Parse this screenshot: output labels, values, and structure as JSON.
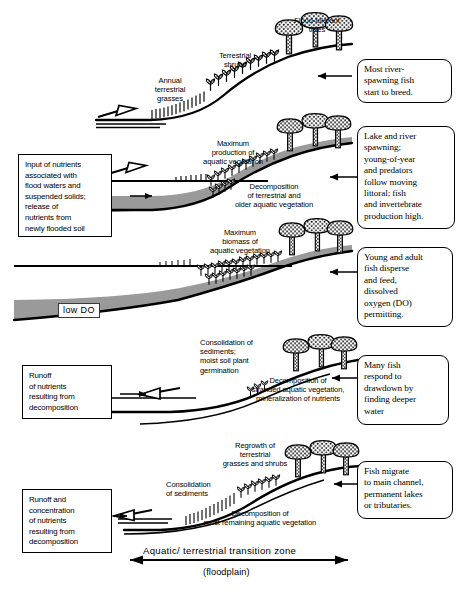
{
  "figure": {
    "title_axis": "Aquatic/ terrestrial   transition   zone",
    "title_axis_sub": "(floodplain)",
    "water_color": "#9a9a9a",
    "ink_color": "#000000"
  },
  "panels": [
    {
      "id": "panel-1-rising-flood",
      "captions": [
        {
          "name": "caption-flood-tolerant-trees",
          "text": "Flood-tolerant\ntrees"
        },
        {
          "name": "caption-terrestrial-shrubs",
          "text": "Terrestrial\nshrubs"
        },
        {
          "name": "caption-annual-terrestrial-grasses",
          "text": "Annual\nterrestrial\ngrasses"
        }
      ],
      "right_callout": {
        "name": "callout-most-river-spawning-fish",
        "text": "Most river-\nspawning fish\nstart to breed."
      },
      "flow_arrow": "rising-right"
    },
    {
      "id": "panel-2-max-production",
      "captions": [
        {
          "name": "caption-maximum-production-aquatic-vegetation",
          "text": "Maximum\nproduction of\naquatic vegetation"
        },
        {
          "name": "caption-decomposition-terrestrial-older-aquatic",
          "text": "Decomposition\nof terrestrial and\nolder aquatic vegetation"
        }
      ],
      "left_box": {
        "name": "box-input-of-nutrients",
        "text": "Input of nutrients\nassociated with\nflood waters and\nsuspended solids;\nrelease of\nnutrients from\nnewly flooded soil"
      },
      "right_callout": {
        "name": "callout-lake-and-river-spawning",
        "text": "Lake and river\nspawning;\nyoung-of-year\nand predators\nfollow moving\nlittoral; fish\nand invertebrate\nproduction high."
      },
      "flow_arrow": "rising-right"
    },
    {
      "id": "panel-3-max-biomass",
      "captions": [
        {
          "name": "caption-maximum-biomass-aquatic-vegetation",
          "text": "Maximum\nbiomass of\naquatic vegetation"
        }
      ],
      "water_label": {
        "name": "label-low-do",
        "text": "low DO"
      },
      "right_callout": {
        "name": "callout-young-and-adult-fish",
        "text": "Young and adult\nfish disperse\nand feed,\ndissolved\noxygen (DO)\npermitting."
      },
      "flow_arrow": "none"
    },
    {
      "id": "panel-4-drawdown",
      "captions": [
        {
          "name": "caption-consolidation-sediments-germination",
          "text": "Consolidation of\nsediments;\nmoist soil plant\ngermination"
        },
        {
          "name": "caption-decomposition-stranded-vegetation",
          "text": "Decomposition of\nstranded aquatic vegetation,\nmineralization of nutrients"
        }
      ],
      "left_box": {
        "name": "box-runoff-of-nutrients",
        "text": "Runoff\nof nutrients\nresulting from\ndecomposition"
      },
      "right_callout": {
        "name": "callout-many-fish-respond-to-drawdown",
        "text": "Many fish\nrespond to\ndrawdown by\nfinding deeper\nwater"
      },
      "flow_arrow": "falling-left"
    },
    {
      "id": "panel-5-regrowth",
      "captions": [
        {
          "name": "caption-regrowth-terrestrial-grasses-shrubs",
          "text": "Regrowth of\nterrestrial\ngrasses and shrubs"
        },
        {
          "name": "caption-consolidation-of-sediments",
          "text": "Consolidation\nof sediments"
        },
        {
          "name": "caption-decomposition-most-remaining",
          "text": "Decomposition of\nmost remaining aquatic vegetation"
        }
      ],
      "left_box": {
        "name": "box-runoff-and-concentration-of-nutrients",
        "text": "Runoff and\nconcentration\nof nutrients\nresulting from\ndecomposition"
      },
      "right_callout": {
        "name": "callout-fish-migrate-to-main-channel",
        "text": "Fish migrate\nto main channel,\npermanent lakes\nor tributaries."
      },
      "flow_arrow": "falling-left"
    }
  ]
}
